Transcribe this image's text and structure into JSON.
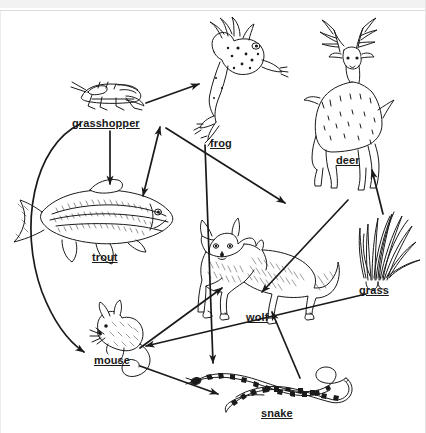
{
  "page": {
    "background_color": "#ffffff",
    "ink_color": "#1a1a1a",
    "width": 426,
    "height": 433
  },
  "chrome": {
    "top_band_color": "#f2f2f2",
    "rule_color": "#dcdcdc"
  },
  "diagram": {
    "kind": "food-web",
    "caption": "Food web showing energy flow between grass, grasshopper, trout, frog, mouse, snake, wolf and deer",
    "organisms": [
      {
        "id": "grasshopper",
        "label": "grasshopper",
        "role": "primary-consumer",
        "x": 110,
        "y": 90
      },
      {
        "id": "frog",
        "label": "frog",
        "role": "secondary-consumer",
        "x": 228,
        "y": 70
      },
      {
        "id": "deer",
        "label": "deer",
        "role": "primary-consumer",
        "x": 348,
        "y": 85
      },
      {
        "id": "trout",
        "label": "trout",
        "role": "secondary-consumer",
        "x": 105,
        "y": 215
      },
      {
        "id": "wolf",
        "label": "wolf",
        "role": "tertiary-consumer",
        "x": 258,
        "y": 265
      },
      {
        "id": "grass",
        "label": "grass",
        "role": "producer",
        "x": 380,
        "y": 240
      },
      {
        "id": "mouse",
        "label": "mouse",
        "role": "primary-consumer",
        "x": 112,
        "y": 325
      },
      {
        "id": "snake",
        "label": "snake",
        "role": "secondary-consumer",
        "x": 285,
        "y": 385
      }
    ],
    "arrows": [
      {
        "from": "grasshopper",
        "to": "frog",
        "style": "straight",
        "heads": 1
      },
      {
        "from": "grasshopper",
        "to": "trout",
        "style": "straight",
        "heads": 1
      },
      {
        "from": "grasshopper",
        "to": "mouse",
        "style": "curved",
        "heads": 1
      },
      {
        "from": "frog",
        "to": "snake",
        "style": "straight",
        "heads": 1
      },
      {
        "from": "grass",
        "to": "grasshopper",
        "style": "straight",
        "heads": 2
      },
      {
        "from": "grass",
        "to": "deer",
        "style": "straight",
        "heads": 1
      },
      {
        "from": "grass",
        "to": "mouse",
        "style": "straight",
        "heads": 1
      },
      {
        "from": "deer",
        "to": "wolf",
        "style": "straight",
        "heads": 1
      },
      {
        "from": "mouse",
        "to": "wolf",
        "style": "straight",
        "heads": 1
      },
      {
        "from": "mouse",
        "to": "snake",
        "style": "straight",
        "heads": 1
      },
      {
        "from": "snake",
        "to": "wolf",
        "style": "straight",
        "heads": 1
      }
    ]
  }
}
